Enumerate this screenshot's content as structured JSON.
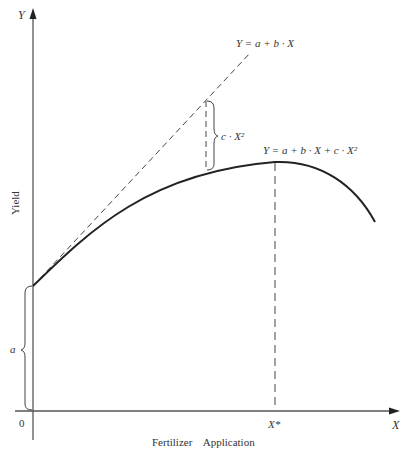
{
  "figure": {
    "y_axis": {
      "symbol": "Y",
      "label": "Yield"
    },
    "x_axis": {
      "symbol": "X",
      "label": "Fertilizer    Application"
    },
    "origin_label": "0",
    "intercept_label": "a",
    "optimum_label": "X*",
    "linear_equation": "Y = a + b · X",
    "quadratic_equation": "Y = a + b · X + c · X²",
    "gap_label": "c · X²",
    "colors": {
      "ink": "#222222",
      "axis": "#555555",
      "text": "#333333"
    }
  }
}
